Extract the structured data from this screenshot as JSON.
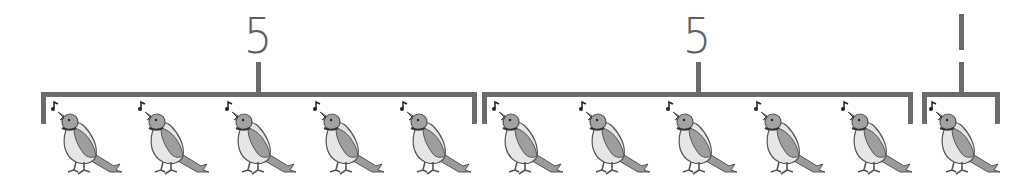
{
  "diagram": {
    "type": "grouping",
    "colors": {
      "stroke": "#6b6b6b",
      "label": "#5f5f5f",
      "bird_body": "#a8a8a8",
      "bird_belly": "#e4e4e4"
    },
    "groups": [
      {
        "label": "5",
        "count": 5
      },
      {
        "label": "5",
        "count": 5
      },
      {
        "label": "1",
        "count": 1
      }
    ],
    "total_birds": 11,
    "bird_icon": "singing-bird-icon"
  }
}
